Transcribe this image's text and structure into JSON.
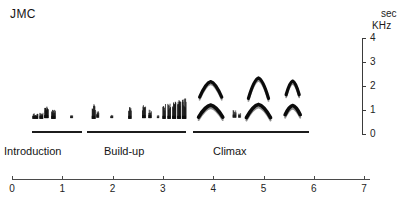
{
  "title": "JMC",
  "freq_axis": {
    "unit": "KHz",
    "ticks": [
      {
        "label": "4",
        "value": 4
      },
      {
        "label": "3",
        "value": 3
      },
      {
        "label": "2",
        "value": 2
      },
      {
        "label": "1",
        "value": 1
      },
      {
        "label": "0",
        "value": 0
      }
    ],
    "range": [
      0,
      4
    ]
  },
  "time_axis": {
    "unit": "sec",
    "ticks": [
      {
        "label": "0",
        "value": 0
      },
      {
        "label": "1",
        "value": 1
      },
      {
        "label": "2",
        "value": 2
      },
      {
        "label": "3",
        "value": 3
      },
      {
        "label": "4",
        "value": 4
      },
      {
        "label": "5",
        "value": 5
      },
      {
        "label": "6",
        "value": 6
      },
      {
        "label": "7",
        "value": 7
      }
    ],
    "range": [
      0,
      7
    ]
  },
  "phases": [
    {
      "label": "Introduction",
      "start": 0.4,
      "end": 1.4,
      "label_x": 4
    },
    {
      "label": "Build-up",
      "start": 1.5,
      "end": 3.45,
      "label_x": 104
    },
    {
      "label": "Climax",
      "start": 3.6,
      "end": 5.9,
      "label_x": 213
    }
  ],
  "chart_data": {
    "type": "scatter",
    "title": "JMC",
    "xlabel": "sec",
    "ylabel": "KHz",
    "xlim": [
      0,
      7
    ],
    "ylim": [
      0,
      4
    ],
    "grid": false,
    "legend": null,
    "series": [
      {
        "name": "Introduction notes",
        "phase": "Introduction",
        "marks": [
          {
            "t": 0.46,
            "f_low": 0.55,
            "f_high": 0.78,
            "w": 0.11,
            "intensity": 0.75
          },
          {
            "t": 0.58,
            "f_low": 0.55,
            "f_high": 0.8,
            "w": 0.07,
            "intensity": 0.8
          },
          {
            "t": 0.68,
            "f_low": 0.58,
            "f_high": 1.12,
            "w": 0.08,
            "intensity": 1.0
          },
          {
            "t": 0.82,
            "f_low": 0.55,
            "f_high": 0.95,
            "w": 0.08,
            "intensity": 0.95
          },
          {
            "t": 1.18,
            "f_low": 0.58,
            "f_high": 0.72,
            "w": 0.05,
            "intensity": 0.5
          }
        ]
      },
      {
        "name": "Build-up pulses",
        "phase": "Build-up",
        "marks": [
          {
            "t": 1.62,
            "f_low": 0.55,
            "f_high": 1.18,
            "w": 0.07,
            "intensity": 0.9
          },
          {
            "t": 1.7,
            "f_low": 0.6,
            "f_high": 0.88,
            "w": 0.05,
            "intensity": 0.6
          },
          {
            "t": 1.98,
            "f_low": 0.58,
            "f_high": 0.72,
            "w": 0.05,
            "intensity": 0.45
          },
          {
            "t": 2.34,
            "f_low": 0.55,
            "f_high": 1.05,
            "w": 0.06,
            "intensity": 0.85
          },
          {
            "t": 2.62,
            "f_low": 0.58,
            "f_high": 1.12,
            "w": 0.07,
            "intensity": 0.9
          },
          {
            "t": 2.74,
            "f_low": 0.58,
            "f_high": 0.95,
            "w": 0.06,
            "intensity": 0.7
          },
          {
            "t": 2.9,
            "f_low": 0.58,
            "f_high": 0.7,
            "w": 0.04,
            "intensity": 0.4
          },
          {
            "t": 3.02,
            "f_low": 0.55,
            "f_high": 1.18,
            "w": 0.06,
            "intensity": 0.9
          },
          {
            "t": 3.12,
            "f_low": 0.55,
            "f_high": 1.22,
            "w": 0.06,
            "intensity": 0.95
          },
          {
            "t": 3.22,
            "f_low": 0.55,
            "f_high": 1.28,
            "w": 0.07,
            "intensity": 1.0
          },
          {
            "t": 3.32,
            "f_low": 0.55,
            "f_high": 1.35,
            "w": 0.07,
            "intensity": 1.0
          },
          {
            "t": 3.42,
            "f_low": 0.55,
            "f_high": 1.4,
            "w": 0.08,
            "intensity": 1.0
          }
        ]
      },
      {
        "name": "Climax calls",
        "phase": "Climax",
        "calls": [
          {
            "t_center": 3.95,
            "upper_band": {
              "peak_f": 2.1,
              "edge_f": 1.45,
              "half_width": 0.22
            },
            "lower_band": {
              "peak_f": 1.12,
              "edge_f": 0.62,
              "half_width": 0.24
            }
          },
          {
            "t_center": 4.9,
            "upper_band": {
              "peak_f": 2.25,
              "edge_f": 1.4,
              "half_width": 0.2
            },
            "lower_band": {
              "peak_f": 1.15,
              "edge_f": 0.6,
              "half_width": 0.24
            }
          },
          {
            "t_center": 5.58,
            "upper_band": {
              "peak_f": 2.12,
              "edge_f": 1.55,
              "half_width": 0.13
            },
            "lower_band": {
              "peak_f": 1.1,
              "edge_f": 0.72,
              "half_width": 0.15
            }
          }
        ],
        "interstitial": [
          {
            "t": 4.42,
            "f_low": 0.6,
            "f_high": 0.92,
            "w": 0.07,
            "intensity": 0.45
          },
          {
            "t": 4.52,
            "f_low": 0.6,
            "f_high": 0.8,
            "w": 0.05,
            "intensity": 0.35
          }
        ]
      }
    ]
  }
}
